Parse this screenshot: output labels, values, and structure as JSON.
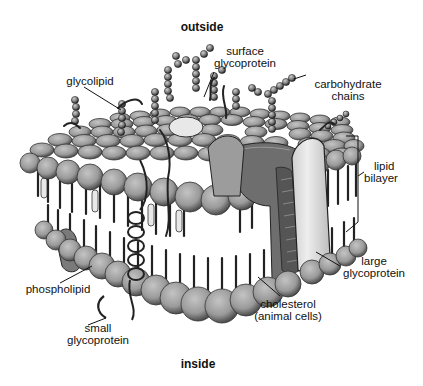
{
  "diagram": {
    "title_outside": "outside",
    "title_inside": "inside",
    "labels": {
      "surface_glycoprotein": [
        "surface",
        "glycoprotein"
      ],
      "glycolipid": [
        "glycolipid"
      ],
      "carbohydrate_chains": [
        "carbohydrate",
        "chains"
      ],
      "lipid_bilayer": [
        "lipid",
        "bilayer"
      ],
      "large_glycoprotein": [
        "large",
        "glycoprotein"
      ],
      "phospholipid": [
        "phospholipid"
      ],
      "cholesterol": [
        "cholesterol",
        "(animal cells)"
      ],
      "small_glycoprotein": [
        "small",
        "glycoprotein"
      ]
    },
    "colors": {
      "head": "#9a9a9a",
      "head_dark": "#5a5a5a",
      "protein_dark": "#6e6e6e",
      "protein_light": "#e2e2e2",
      "line": "#111111",
      "background": "#ffffff"
    }
  }
}
